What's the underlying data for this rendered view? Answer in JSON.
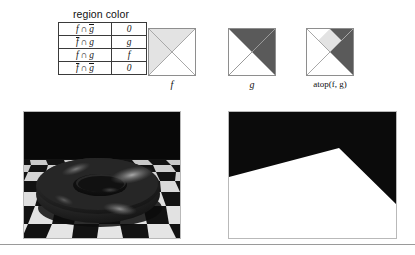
{
  "figure": {
    "table": {
      "title": "region color",
      "columns": [
        "region",
        "color"
      ],
      "rows": [
        {
          "region_f": "f",
          "region_op": "∩",
          "region_g": "g",
          "f_bar": false,
          "g_bar": true,
          "color": "0"
        },
        {
          "region_f": "f",
          "region_op": "∩",
          "region_g": "g",
          "f_bar": true,
          "g_bar": false,
          "color": "g"
        },
        {
          "region_f": "f",
          "region_op": "∩",
          "region_g": "g",
          "f_bar": false,
          "g_bar": false,
          "color": "f"
        },
        {
          "region_f": "f",
          "region_op": "∩",
          "region_g": "g",
          "f_bar": true,
          "g_bar": true,
          "color": "0"
        }
      ]
    },
    "squares": [
      {
        "caption": "f",
        "style": "italic"
      },
      {
        "caption": "g",
        "style": "italic"
      },
      {
        "caption": "atop(f, g)",
        "style": "roman"
      }
    ],
    "colors": {
      "light_gray": "#e3e3e3",
      "dark_gray": "#5a5a5a",
      "white": "#ffffff",
      "diagonal_line": "#a8a8a8",
      "square_border": "#8e8e8e",
      "image_border": "#b9b9b9",
      "checker_light": "#d7d7d7",
      "checker_dark": "#131313",
      "background_dark": "#080808",
      "torus_dark": "#2b2b2b",
      "torus_highlight": "#8f8f8f",
      "matte_black": "#0b0b0b",
      "matte_white": "#ffffff"
    }
  },
  "images": {
    "render": {
      "name": "torus-on-checkerboard-render",
      "description": "3D rendered dark torus resting on a black-and-white checkerboard floor with a dark background"
    },
    "matte": {
      "name": "floor-coverage-matte",
      "description": "Black and white coverage matte showing the white floor silhouette against black background"
    }
  }
}
